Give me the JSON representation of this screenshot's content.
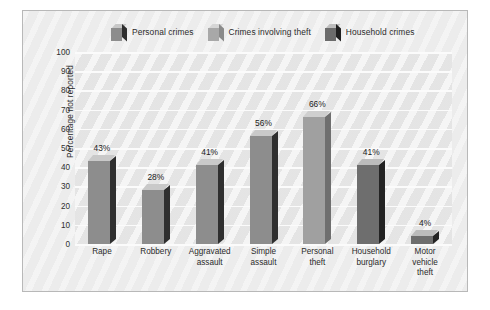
{
  "chart_data": {
    "type": "bar",
    "title": "",
    "xlabel": "",
    "ylabel": "Percentage not reported",
    "ylim": [
      0,
      100
    ],
    "ytick_step": 10,
    "yticks": [
      "100",
      "90",
      "80",
      "70",
      "60",
      "50",
      "40",
      "30",
      "20",
      "10",
      "0"
    ],
    "grid": true,
    "legend_position": "top",
    "categories": [
      "Rape",
      "Robbery",
      "Aggravated assault",
      "Simple assault",
      "Personal theft",
      "Household burglary",
      "Motor vehicle theft"
    ],
    "values": [
      43,
      28,
      41,
      56,
      66,
      41,
      4
    ],
    "value_labels": [
      "43%",
      "28%",
      "41%",
      "56%",
      "66%",
      "41%",
      "4%"
    ],
    "series": [
      {
        "name": "Personal crimes",
        "color": "#8d8d8d",
        "members": [
          "Rape",
          "Robbery",
          "Aggravated assault",
          "Simple assault"
        ]
      },
      {
        "name": "Crimes involving theft",
        "color": "#a5a5a5",
        "members": [
          "Personal theft"
        ]
      },
      {
        "name": "Household crimes",
        "color": "#6b6b6b",
        "members": [
          "Household burglary",
          "Motor vehicle theft"
        ]
      }
    ]
  },
  "legend": {
    "items": [
      {
        "label": "Personal crimes",
        "color": "#8d8d8d",
        "top_color": "#c8c8c8",
        "side_color": "#2e2e2e"
      },
      {
        "label": "Crimes involving theft",
        "color": "#a8a8a8",
        "top_color": "#d6d6d6",
        "side_color": "#8a8a8a"
      },
      {
        "label": "Household crimes",
        "color": "#6b6b6b",
        "top_color": "#bdbdbd",
        "side_color": "#1f1f1f"
      }
    ]
  },
  "bars": [
    {
      "category_lines": [
        "Rape"
      ],
      "value": 43,
      "label": "43%",
      "series": "Personal crimes",
      "front": "#8d8d8d",
      "top": "#c9c9c9",
      "side": "#2f2f2f"
    },
    {
      "category_lines": [
        "Robbery"
      ],
      "value": 28,
      "label": "28%",
      "series": "Personal crimes",
      "front": "#8d8d8d",
      "top": "#c9c9c9",
      "side": "#2f2f2f"
    },
    {
      "category_lines": [
        "Aggravated",
        "assault"
      ],
      "value": 41,
      "label": "41%",
      "series": "Personal crimes",
      "front": "#8d8d8d",
      "top": "#c9c9c9",
      "side": "#2f2f2f"
    },
    {
      "category_lines": [
        "Simple",
        "assault"
      ],
      "value": 56,
      "label": "56%",
      "series": "Personal crimes",
      "front": "#8d8d8d",
      "top": "#c9c9c9",
      "side": "#2f2f2f"
    },
    {
      "category_lines": [
        "Personal",
        "theft"
      ],
      "value": 66,
      "label": "66%",
      "series": "Crimes involving theft",
      "front": "#a0a0a0",
      "top": "#cfcfcf",
      "side": "#6f6f6f"
    },
    {
      "category_lines": [
        "Household",
        "burglary"
      ],
      "value": 41,
      "label": "41%",
      "series": "Household crimes",
      "front": "#6e6e6e",
      "top": "#bcbcbc",
      "side": "#232323"
    },
    {
      "category_lines": [
        "Motor",
        "vehicle",
        "theft"
      ],
      "value": 4,
      "label": "4%",
      "series": "Household crimes",
      "front": "#6e6e6e",
      "top": "#bcbcbc",
      "side": "#232323"
    }
  ]
}
